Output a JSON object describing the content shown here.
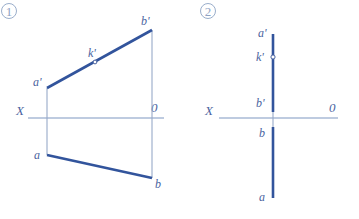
{
  "figure": {
    "kind": "descriptive-geometry-projection",
    "background_color": "#ffffff",
    "heavy_line_color": "#32549c",
    "thin_line_color": "#97a9c8",
    "axis_color": "#7f97c2",
    "label_color": "#4a63a0",
    "number_color": "#8fa3c4"
  },
  "panels": [
    {
      "id": "panel-1",
      "number": "①",
      "number_plain": "1",
      "axis": {
        "left_label": "X",
        "right_label": "0"
      },
      "points": [
        {
          "id": "a-prime",
          "label": "a'"
        },
        {
          "id": "k-prime",
          "label": "k'"
        },
        {
          "id": "b-prime",
          "label": "b'"
        },
        {
          "id": "a",
          "label": "a"
        },
        {
          "id": "b",
          "label": "b"
        }
      ]
    },
    {
      "id": "panel-2",
      "number": "②",
      "number_plain": "2",
      "axis": {
        "left_label": "X",
        "right_label": "0"
      },
      "points": [
        {
          "id": "a-prime",
          "label": "a'"
        },
        {
          "id": "k-prime",
          "label": "k'"
        },
        {
          "id": "b-prime",
          "label": "b'"
        },
        {
          "id": "b",
          "label": "b"
        },
        {
          "id": "a",
          "label": "a"
        }
      ]
    }
  ]
}
